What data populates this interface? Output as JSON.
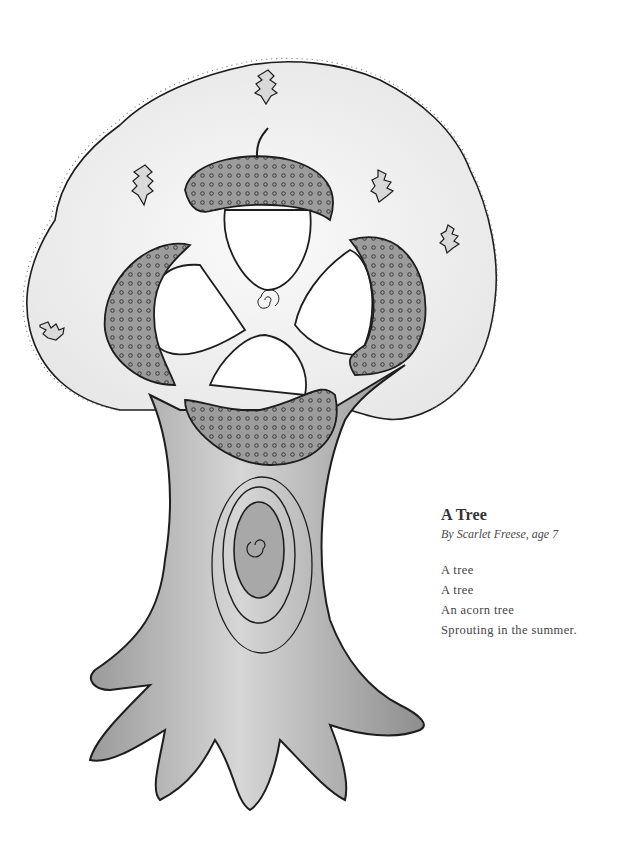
{
  "illustration": {
    "subject": "tree-with-acorns",
    "colors": {
      "ink": "#1e1e1e",
      "shade_dark": "#8a8a8a",
      "shade_mid": "#b4b4b4",
      "shade_light": "#d8d8d8",
      "canopy": "#f1f1f1",
      "paper": "#ffffff"
    }
  },
  "poem": {
    "title": "A Tree",
    "byline": "By Scarlet Freese, age 7",
    "lines": [
      "A tree",
      "A tree",
      "An acorn tree",
      "Sprouting in the summer."
    ]
  }
}
